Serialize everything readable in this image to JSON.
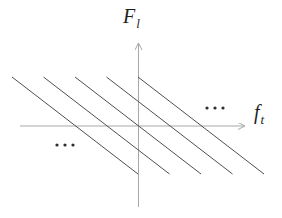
{
  "diagram": {
    "type": "axes-with-parallel-spectral-lines",
    "colors": {
      "background": "#ffffff",
      "axis": "#a8a8a8",
      "line": "#4f4f4f",
      "dot": "#2e2e2e",
      "text": "#1f1f1f"
    },
    "vertical_axis_label": {
      "base": "F",
      "subscript": "l"
    },
    "horizontal_axis_label": {
      "base": "f",
      "subscript": "t"
    },
    "axes": {
      "horizontal": {
        "x1": 20,
        "y1": 126,
        "x2": 245,
        "y2": 126
      },
      "vertical": {
        "x1": 138.5,
        "y1": 207,
        "x2": 138.5,
        "y2": 43
      }
    },
    "lines": [
      {
        "x1": 12,
        "y1": 77,
        "x2": 138,
        "y2": 174
      },
      {
        "x1": 43.5,
        "y1": 77,
        "x2": 169.5,
        "y2": 174
      },
      {
        "x1": 75,
        "y1": 77,
        "x2": 201,
        "y2": 174
      },
      {
        "x1": 106.5,
        "y1": 77,
        "x2": 232.5,
        "y2": 174
      },
      {
        "x1": 138,
        "y1": 77,
        "x2": 264,
        "y2": 174
      }
    ],
    "ellipses": [
      {
        "name": "ellipsis-top-right",
        "cx": 215,
        "cy": 108,
        "spacing": 8,
        "radius": 1.6
      },
      {
        "name": "ellipsis-bottom-left",
        "cx": 65,
        "cy": 145,
        "spacing": 8,
        "radius": 1.6
      }
    ]
  }
}
